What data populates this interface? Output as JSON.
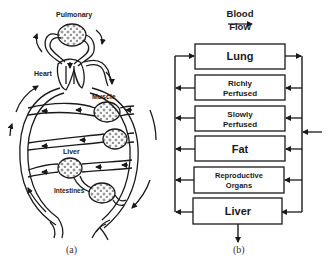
{
  "panel_a": {
    "caption": "(a)",
    "labels": {
      "pulmonary": "Pulmonary",
      "heart": "Heart",
      "muscle": "Muscle",
      "liver": "Liver",
      "intestines": "Intestines"
    }
  },
  "panel_b": {
    "caption": "(b)",
    "flow_label_line1": "Blood",
    "flow_label_line2": "Flow",
    "compartments": [
      {
        "line1": "Lung",
        "line2": ""
      },
      {
        "line1": "Richly",
        "line2": "Perfused"
      },
      {
        "line1": "Slowly",
        "line2": "Perfused"
      },
      {
        "line1": "Fat",
        "line2": ""
      },
      {
        "line1": "Reproductive",
        "line2": "Organs"
      },
      {
        "line1": "Liver",
        "line2": ""
      }
    ]
  },
  "colors": {
    "stroke": "#1a1a1a",
    "background": "#ffffff"
  }
}
